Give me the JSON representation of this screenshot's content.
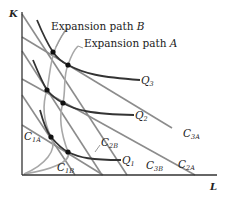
{
  "diagram": {
    "axes": {
      "y_label": "K",
      "x_label": "L"
    },
    "expansion_paths": [
      {
        "name": "Expansion path B",
        "prefix": "Expansion path ",
        "letter": "B"
      },
      {
        "name": "Expansion path A",
        "prefix": "Expansion path ",
        "letter": "A"
      }
    ],
    "isoquants": [
      {
        "label": "Q",
        "sub": "1"
      },
      {
        "label": "Q",
        "sub": "2"
      },
      {
        "label": "Q",
        "sub": "3"
      }
    ],
    "isocosts": {
      "c1a": {
        "label": "C",
        "sub": "1A"
      },
      "c1b": {
        "label": "C",
        "sub": "1B"
      },
      "c2a": {
        "label": "C",
        "sub": "2A"
      },
      "c2b": {
        "label": "C",
        "sub": "2B"
      },
      "c3a": {
        "label": "C",
        "sub": "3A"
      },
      "c3b": {
        "label": "C",
        "sub": "3B"
      }
    },
    "colors": {
      "isoquant": "#333333",
      "isocost": "#8c8c8c",
      "path": "#a0a0a0",
      "axis": "#333333",
      "point": "#111111"
    }
  }
}
